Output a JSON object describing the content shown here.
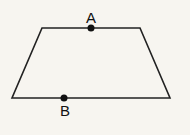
{
  "figure": {
    "shape": "trapezoid",
    "vertices": [
      [
        42,
        28
      ],
      [
        140,
        28
      ],
      [
        170,
        98
      ],
      [
        12,
        98
      ]
    ],
    "stroke_color": "#222222",
    "background": "#f7f5f0"
  },
  "points": [
    {
      "label": "A",
      "x": 91,
      "y": 28,
      "label_x": 91,
      "label_y": 23
    },
    {
      "label": "B",
      "x": 64,
      "y": 98,
      "label_x": 65,
      "label_y": 116
    }
  ]
}
